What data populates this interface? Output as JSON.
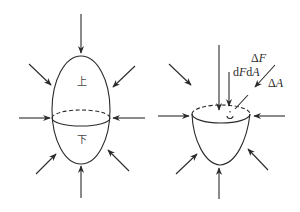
{
  "figure": {
    "left": {
      "description": "Closed ellipsoidal body divided into upper and lower parts, under surrounding pressure arrows",
      "upper_label": "上",
      "lower_label": "下",
      "arrow_count": 8
    },
    "right": {
      "description": "Lower cut-off part (cup) with surface element and force labels",
      "labels": {
        "delta_f": "ΔF",
        "df_prefix": "d",
        "df_var": "F",
        "da_prefix": "d",
        "da_var": "A",
        "delta_a": "ΔA",
        "delta_symbol": "Δ",
        "f_var": "F",
        "a_var": "A"
      },
      "arrow_count": 8
    }
  },
  "colors": {
    "line": "#2a2a2a",
    "background": "#ffffff"
  }
}
